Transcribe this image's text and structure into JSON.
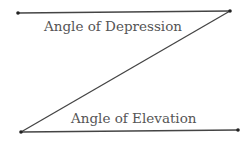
{
  "diagram": {
    "labels": {
      "depression": "Angle of Depression",
      "elevation": "Angle of Elevation"
    },
    "colors": {
      "line": "#444444",
      "text": "#555555",
      "point": "#222222"
    },
    "points": {
      "top_left": [
        18,
        13
      ],
      "top_right": [
        230,
        11
      ],
      "bottom_left": [
        21,
        132
      ],
      "bottom_right": [
        238,
        130
      ]
    },
    "lines": [
      {
        "name": "top-horizontal",
        "from": "top_left",
        "to": "top_right"
      },
      {
        "name": "transversal",
        "from": "top_right",
        "to": "bottom_left"
      },
      {
        "name": "bottom-horizontal",
        "from": "bottom_left",
        "to": "bottom_right"
      }
    ]
  }
}
